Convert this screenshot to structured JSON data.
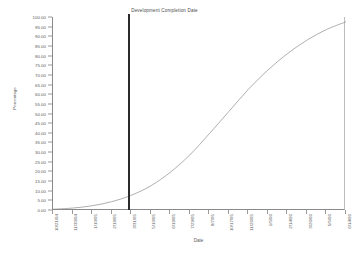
{
  "chart_data": {
    "type": "line",
    "title": "",
    "xlabel": "Date",
    "ylabel": "Percentage",
    "ylim": [
      0,
      100
    ],
    "grid": false,
    "legend": "none",
    "y_ticks": [
      "0.00",
      "5.00",
      "10.00",
      "15.00",
      "20.00",
      "25.00",
      "30.00",
      "35.00",
      "40.00",
      "45.00",
      "50.00",
      "55.00",
      "60.00",
      "65.00",
      "70.00",
      "75.00",
      "80.00",
      "85.00",
      "90.00",
      "95.00",
      "100.00"
    ],
    "y_tick_values": [
      0,
      5,
      10,
      15,
      20,
      25,
      30,
      35,
      40,
      45,
      50,
      55,
      60,
      65,
      70,
      75,
      80,
      85,
      90,
      95,
      100
    ],
    "categories": [
      "10/21/04",
      "11/30/04",
      "1/10/05",
      "2/19/05",
      "3/31/05",
      "5/10/05",
      "6/19/05",
      "7/29/05",
      "9/7/05",
      "10/17/05",
      "11/26/05",
      "1/5/06",
      "2/14/06",
      "3/26/06",
      "5/5/06",
      "6/14/06"
    ],
    "x": [
      0,
      6.667,
      13.333,
      20,
      26.667,
      33.333,
      40,
      46.667,
      53.333,
      60,
      66.667,
      73.333,
      80,
      86.667,
      93.333,
      100
    ],
    "series": [
      {
        "name": "Cumulative Completion",
        "values": [
          0.4,
          1.0,
          2.2,
          4.3,
          7.6,
          12.5,
          19.5,
          28.5,
          39.5,
          51.0,
          62.5,
          72.5,
          81.0,
          88.0,
          93.5,
          97.5
        ],
        "color": "#8c8c8c"
      }
    ],
    "annotations": [
      {
        "name": "development-completion-date",
        "label": "Development Completion Date",
        "x_position_pct": 26.0,
        "color": "#2b2b2b"
      }
    ]
  },
  "axis": {
    "x_title": "Date",
    "y_title": "Percentage"
  },
  "colors": {
    "curve": "#8c8c8c",
    "marker": "#2b2b2b",
    "axis": "#8a8a8a",
    "text": "#5b5b5b",
    "background": "#ffffff"
  }
}
